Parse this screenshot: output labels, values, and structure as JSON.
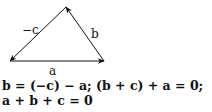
{
  "diagram": {
    "vertices": {
      "bottom_left": [
        10,
        61
      ],
      "bottom_right": [
        104,
        61
      ],
      "top": [
        66,
        7
      ]
    },
    "vectors": [
      {
        "label": "a",
        "from": "bottom_left",
        "to": "bottom_right"
      },
      {
        "label": "b",
        "from": "bottom_right",
        "to": "top"
      },
      {
        "label": "−c",
        "from": "top",
        "to": "bottom_left"
      }
    ],
    "labels": {
      "a": "a",
      "b": "b",
      "neg_c": "−c"
    },
    "stroke_color": "#111111"
  },
  "equations": {
    "line1": "b = (−c) − a;  (b + c) + a = 0;",
    "line2": "a + b + c = 0"
  }
}
